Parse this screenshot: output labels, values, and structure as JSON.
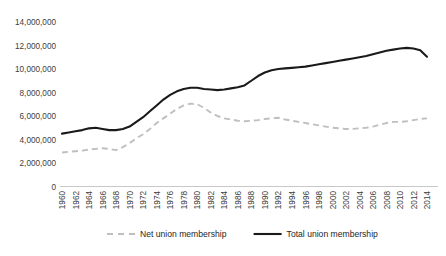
{
  "chart_data": {
    "type": "line",
    "title": "",
    "xlabel": "",
    "ylabel": "",
    "grid": false,
    "legend_position": "bottom",
    "ylim": [
      0,
      14000000
    ],
    "yticks": [
      0,
      2000000,
      4000000,
      6000000,
      8000000,
      10000000,
      12000000,
      14000000
    ],
    "ytick_labels": [
      "0",
      "2,000,000",
      "4,000,000",
      "6,000,000",
      "8,000,000",
      "10,000,000",
      "12,000,000",
      "14,000,000"
    ],
    "xlim": [
      1960,
      2014
    ],
    "xticks": [
      1960,
      1962,
      1964,
      1966,
      1968,
      1970,
      1972,
      1974,
      1976,
      1978,
      1980,
      1982,
      1984,
      1986,
      1988,
      1990,
      1992,
      1994,
      1996,
      1998,
      2000,
      2002,
      2004,
      2006,
      2008,
      2010,
      2012,
      2014
    ],
    "xtick_labels": [
      "1960",
      "1962",
      "1964",
      "1966",
      "1968",
      "1970",
      "1972",
      "1974",
      "1976",
      "1978",
      "1980",
      "1982",
      "1984",
      "1986",
      "1988",
      "1990",
      "1992",
      "1994",
      "1996",
      "1998",
      "2000",
      "2002",
      "2004",
      "2006",
      "2008",
      "2010",
      "2012",
      "2014"
    ],
    "x": [
      1960,
      1961,
      1962,
      1963,
      1964,
      1965,
      1966,
      1967,
      1968,
      1969,
      1970,
      1971,
      1972,
      1973,
      1974,
      1975,
      1976,
      1977,
      1978,
      1979,
      1980,
      1981,
      1982,
      1983,
      1984,
      1985,
      1986,
      1987,
      1988,
      1989,
      1990,
      1991,
      1992,
      1993,
      1994,
      1995,
      1996,
      1997,
      1998,
      1999,
      2000,
      2001,
      2002,
      2003,
      2004,
      2005,
      2006,
      2007,
      2008,
      2009,
      2010,
      2011,
      2012,
      2013,
      2014
    ],
    "series": [
      {
        "name": "Net union membership",
        "color": "#bfbfbf",
        "style": "dashed",
        "values": [
          2900000,
          2950000,
          3000000,
          3050000,
          3150000,
          3200000,
          3250000,
          3200000,
          3100000,
          3350000,
          3700000,
          4100000,
          4450000,
          4900000,
          5400000,
          5800000,
          6200000,
          6600000,
          6900000,
          7050000,
          7000000,
          6700000,
          6300000,
          6000000,
          5800000,
          5700000,
          5600000,
          5550000,
          5600000,
          5650000,
          5750000,
          5800000,
          5850000,
          5700000,
          5600000,
          5500000,
          5400000,
          5300000,
          5200000,
          5100000,
          5000000,
          4950000,
          4900000,
          4900000,
          4950000,
          5000000,
          5100000,
          5250000,
          5400000,
          5500000,
          5500000,
          5550000,
          5650000,
          5750000,
          5800000
        ]
      },
      {
        "name": "Total union membership",
        "color": "#1a1a1a",
        "style": "solid",
        "values": [
          4500000,
          4600000,
          4700000,
          4800000,
          4950000,
          5000000,
          4900000,
          4800000,
          4800000,
          4900000,
          5100000,
          5500000,
          5900000,
          6400000,
          6900000,
          7400000,
          7800000,
          8100000,
          8300000,
          8400000,
          8400000,
          8300000,
          8250000,
          8200000,
          8250000,
          8350000,
          8450000,
          8600000,
          9000000,
          9400000,
          9700000,
          9900000,
          10000000,
          10050000,
          10100000,
          10150000,
          10200000,
          10300000,
          10400000,
          10500000,
          10600000,
          10700000,
          10800000,
          10900000,
          11000000,
          11100000,
          11250000,
          11400000,
          11550000,
          11650000,
          11750000,
          11800000,
          11750000,
          11600000,
          11050000
        ]
      }
    ]
  },
  "legend": {
    "items": [
      {
        "label": "Net union membership",
        "color": "#bfbfbf",
        "style": "dashed"
      },
      {
        "label": "Total union membership",
        "color": "#1a1a1a",
        "style": "solid"
      }
    ]
  }
}
